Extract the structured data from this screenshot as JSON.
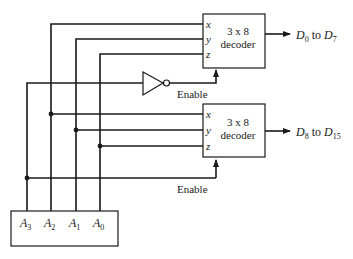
{
  "diagram": {
    "decoder_top": {
      "label_line1": "3 x 8",
      "label_line2": "decoder",
      "inputs": [
        "x",
        "y",
        "z"
      ],
      "enable_label": "Enable",
      "output_label": "D",
      "output_from_sub": "0",
      "output_to_word": " to ",
      "output_to_sub": "7"
    },
    "decoder_bottom": {
      "label_line1": "3 x 8",
      "label_line2": "decoder",
      "inputs": [
        "x",
        "y",
        "z"
      ],
      "enable_label": "Enable",
      "output_label": "D",
      "output_from_sub": "8",
      "output_to_word": " to ",
      "output_to_sub": "15"
    },
    "address_box": {
      "inputs": [
        {
          "name": "A",
          "sub": "3"
        },
        {
          "name": "A",
          "sub": "2"
        },
        {
          "name": "A",
          "sub": "1"
        },
        {
          "name": "A",
          "sub": "0"
        }
      ]
    },
    "colors": {
      "line": "#1a1a1a",
      "background": "#ffffff"
    }
  }
}
